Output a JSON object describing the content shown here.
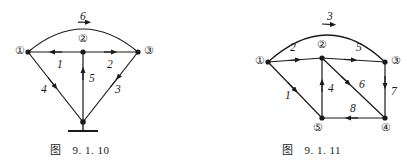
{
  "page": {
    "background_color": "#ffffff",
    "ink_color": "#1a1a1a",
    "width": 407,
    "height": 168
  },
  "figures": [
    {
      "id": "fig-9-1-10",
      "caption_word": "图",
      "caption_number": "9. 1. 10",
      "nodes": [
        {
          "id": "n1",
          "label": "①",
          "x": 28,
          "y": 52,
          "label_x": 15,
          "label_y": 46,
          "circled": true
        },
        {
          "id": "n2",
          "label": "②",
          "x": 83,
          "y": 52,
          "label_x": 78,
          "label_y": 34,
          "circled": true
        },
        {
          "id": "n3",
          "label": "③",
          "x": 138,
          "y": 52,
          "label_x": 144,
          "label_y": 46,
          "circled": true
        },
        {
          "id": "ng",
          "label": "",
          "x": 83,
          "y": 122,
          "label_x": 0,
          "label_y": 0,
          "circled": false
        }
      ],
      "edges": [
        {
          "id": "e6",
          "label": "6",
          "from": "n1",
          "to": "n3",
          "shape": "arc",
          "label_x": 80,
          "label_y": 13
        },
        {
          "id": "e1",
          "label": "1",
          "from": "n2",
          "to": "n1",
          "shape": "line",
          "label_x": 57,
          "label_y": 58
        },
        {
          "id": "e2",
          "label": "2",
          "from": "n2",
          "to": "n3",
          "shape": "line",
          "label_x": 107,
          "label_y": 58
        },
        {
          "id": "e5",
          "label": "5",
          "from": "ng",
          "to": "n2",
          "shape": "line",
          "label_x": 88,
          "label_y": 76
        },
        {
          "id": "e4",
          "label": "4",
          "from": "n1",
          "to": "ng",
          "shape": "line",
          "label_x": 43,
          "label_y": 86
        },
        {
          "id": "e3",
          "label": "3",
          "from": "ng",
          "to": "n3",
          "shape": "line",
          "label_x": 115,
          "label_y": 86
        }
      ],
      "ground_symbol": true
    },
    {
      "id": "fig-9-1-11",
      "caption_word": "图",
      "caption_number": "9. 1. 11",
      "nodes": [
        {
          "id": "m1",
          "label": "①",
          "x": 268,
          "y": 62,
          "label_x": 255,
          "label_y": 56,
          "circled": true
        },
        {
          "id": "m2",
          "label": "②",
          "x": 322,
          "y": 58,
          "label_x": 317,
          "label_y": 40,
          "circled": true
        },
        {
          "id": "m3",
          "label": "③",
          "x": 385,
          "y": 62,
          "label_x": 391,
          "label_y": 56,
          "circled": true
        },
        {
          "id": "m4",
          "label": "④",
          "x": 385,
          "y": 118,
          "label_x": 381,
          "label_y": 125,
          "circled": true
        },
        {
          "id": "m5",
          "label": "⑤",
          "x": 322,
          "y": 118,
          "label_x": 313,
          "label_y": 125,
          "circled": true
        }
      ],
      "edges": [
        {
          "id": "f3",
          "label": "3",
          "from": "m1",
          "to": "m3",
          "shape": "arc",
          "label_x": 327,
          "label_y": 13
        },
        {
          "id": "f2",
          "label": "2",
          "from": "m1",
          "to": "m2",
          "shape": "line",
          "label_x": 291,
          "label_y": 44
        },
        {
          "id": "f5",
          "label": "5",
          "from": "m2",
          "to": "m3",
          "shape": "line",
          "label_x": 356,
          "label_y": 44
        },
        {
          "id": "f1",
          "label": "1",
          "from": "m1",
          "to": "m5",
          "shape": "line",
          "label_x": 287,
          "label_y": 92
        },
        {
          "id": "f4",
          "label": "4",
          "from": "m5",
          "to": "m2",
          "shape": "line",
          "label_x": 328,
          "label_y": 86
        },
        {
          "id": "f6",
          "label": "6",
          "from": "m2",
          "to": "m4",
          "shape": "line",
          "label_x": 359,
          "label_y": 82
        },
        {
          "id": "f7",
          "label": "7",
          "from": "m3",
          "to": "m4",
          "shape": "line",
          "label_x": 391,
          "label_y": 88
        },
        {
          "id": "f8",
          "label": "8",
          "from": "m4",
          "to": "m5",
          "shape": "line",
          "label_x": 350,
          "label_y": 105
        }
      ],
      "ground_symbol": false
    }
  ]
}
